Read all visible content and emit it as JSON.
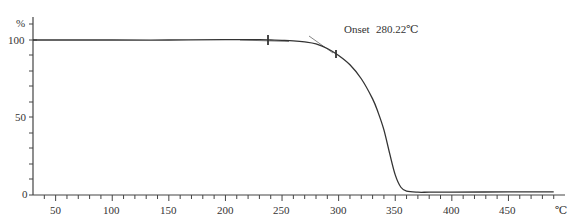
{
  "chart_data": {
    "type": "line",
    "title": "",
    "xlabel": "℃",
    "ylabel": "%",
    "xlim": [
      30,
      490
    ],
    "ylim": [
      0,
      100
    ],
    "grid": false,
    "legend": null,
    "x_ticks": [
      50,
      100,
      150,
      200,
      250,
      300,
      350,
      400,
      450
    ],
    "x_tick_labels": [
      "50",
      "100",
      "150",
      "200",
      "250",
      "300",
      "350",
      "400",
      "450"
    ],
    "y_ticks": [
      0,
      50,
      100
    ],
    "y_tick_labels": [
      "0",
      "50",
      "100"
    ],
    "series": [
      {
        "name": "TG",
        "color": "#333333",
        "x": [
          30,
          100,
          150,
          200,
          230,
          240,
          250,
          260,
          270,
          280,
          290,
          300,
          310,
          320,
          330,
          335,
          340,
          345,
          350,
          355,
          360,
          370,
          380,
          400,
          450,
          490
        ],
        "y": [
          100,
          100,
          100,
          100.3,
          100.2,
          100,
          99.8,
          99.5,
          98.8,
          97.5,
          94.5,
          90,
          84,
          75,
          62,
          53,
          42,
          27,
          13,
          5,
          2.5,
          1.8,
          1.8,
          1.8,
          2,
          2
        ]
      }
    ],
    "annotations": [
      {
        "label": "Onset",
        "value": "280.22℃",
        "x": 280.22,
        "y": 98
      }
    ],
    "markers": [
      {
        "x": 238,
        "y": 100
      },
      {
        "x": 299,
        "y": 91
      }
    ],
    "tangent_lines": [
      {
        "from": [
          240,
          100
        ],
        "to": [
          285,
          99.2
        ]
      },
      {
        "from": [
          272,
          102
        ],
        "to": [
          300,
          90
        ]
      }
    ]
  },
  "labels": {
    "y_unit": "%",
    "x_unit": "℃",
    "onset_label": "Onset",
    "onset_value": "280.22℃",
    "y_tick_0": "0",
    "y_tick_50": "50",
    "y_tick_100": "100",
    "x_tick_50": "50",
    "x_tick_100": "100",
    "x_tick_150": "150",
    "x_tick_200": "200",
    "x_tick_250": "250",
    "x_tick_300": "300",
    "x_tick_350": "350",
    "x_tick_400": "400",
    "x_tick_450": "450"
  },
  "colors": {
    "axis": "#444444",
    "curve": "#333333",
    "tangent": "#666666"
  }
}
